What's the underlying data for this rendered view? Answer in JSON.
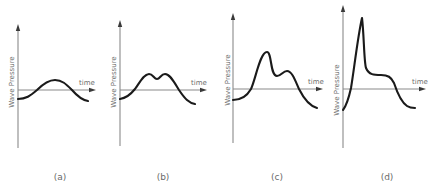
{
  "figure": {
    "panels": [
      {
        "id": "a",
        "caption": "(a)",
        "y_label": "Wave Pressure",
        "x_label": "time",
        "description": "single smooth hump"
      },
      {
        "id": "b",
        "caption": "(b)",
        "y_label": "Wave Pressure",
        "x_label": "time",
        "description": "double-peaked hump of equal peaks"
      },
      {
        "id": "c",
        "caption": "(c)",
        "y_label": "Wave Pressure",
        "x_label": "time",
        "description": "tall first peak followed by smaller second peak"
      },
      {
        "id": "d",
        "caption": "(d)",
        "y_label": "Wave Pressure",
        "x_label": "time",
        "description": "very sharp impulsive peak followed by plateau"
      }
    ],
    "colors": {
      "curve": "#1a1a1a",
      "axis": "#8a8a8a",
      "text": "#6e6e6e",
      "background": "#ffffff"
    }
  }
}
